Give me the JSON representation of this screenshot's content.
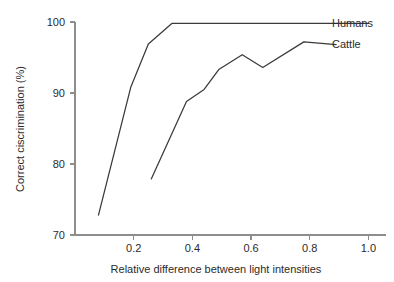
{
  "chart_data": {
    "type": "line",
    "title": "",
    "subtitle": "",
    "xlabel": "Relative difference between light intensities",
    "ylabel": "Correct ciscrimination (%)",
    "xlim": [
      0.0,
      1.06
    ],
    "ylim": [
      70,
      100
    ],
    "grid": false,
    "legend_position": "right-inline-labels",
    "xticks": [
      0.2,
      0.4,
      0.6,
      0.8,
      1.0
    ],
    "xticklabels": [
      "0.2",
      "0.4",
      "0.6",
      "0.8",
      "1.0"
    ],
    "yticks": [
      70,
      80,
      90,
      100
    ],
    "yticklabels": [
      "70",
      "80",
      "90",
      "100"
    ],
    "series": [
      {
        "name": "Humans",
        "label": "Humans",
        "color": "#3a3a3a",
        "x": [
          0.08,
          0.19,
          0.25,
          0.33,
          1.0
        ],
        "y": [
          72.8,
          90.8,
          96.9,
          99.8,
          99.8
        ]
      },
      {
        "name": "Cattle",
        "label": "Cattle",
        "color": "#3a3a3a",
        "x": [
          0.26,
          0.38,
          0.44,
          0.49,
          0.57,
          0.64,
          0.78,
          0.89
        ],
        "y": [
          77.9,
          88.8,
          90.5,
          93.3,
          95.4,
          93.6,
          97.2,
          96.8
        ]
      }
    ]
  },
  "labels": {
    "humans": "Humans",
    "cattle": "Cattle"
  }
}
